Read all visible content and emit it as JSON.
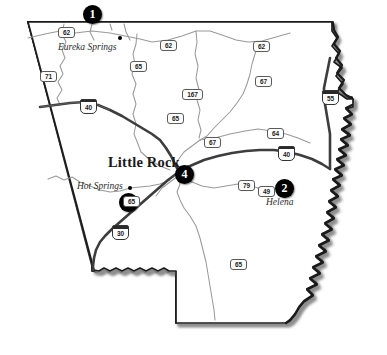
{
  "map": {
    "title": "Arkansas state map with numbered location markers",
    "state": "Arkansas",
    "background_color": "#ffffff",
    "outline_color": "#1a1a1a",
    "interstate_color": "#4a4a4a",
    "highway_color": "#8a8a8a",
    "marker_color": "#000000",
    "marker_text_color": "#ffffff"
  },
  "cities": [
    {
      "name": "Eureka Springs",
      "style": "minor",
      "x": 58,
      "y": 43,
      "dot_x": 118,
      "dot_y": 36
    },
    {
      "name": "Little Rock",
      "style": "major",
      "x": 111,
      "y": 162,
      "dot_x": -1,
      "dot_y": -1
    },
    {
      "name": "Hot Springs",
      "style": "minor",
      "x": 77,
      "y": 182,
      "dot_x": 128,
      "dot_y": 186
    },
    {
      "name": "Helena",
      "style": "minor",
      "x": 268,
      "y": 198,
      "dot_x": -1,
      "dot_y": -1
    }
  ],
  "markers": [
    {
      "label": "1",
      "x": 83,
      "y": 13,
      "near": "Eureka Springs"
    },
    {
      "label": "2",
      "x": 275,
      "y": 179,
      "near": "Helena"
    },
    {
      "label": "3",
      "x": 119,
      "y": 193,
      "near": "Hot Springs"
    },
    {
      "label": "4",
      "x": 175,
      "y": 169,
      "near": "Little Rock"
    }
  ],
  "highway_shields": [
    {
      "number": "62",
      "type": "us",
      "x": 58,
      "y": 27
    },
    {
      "number": "62",
      "type": "us",
      "x": 160,
      "y": 40
    },
    {
      "number": "62",
      "type": "us",
      "x": 253,
      "y": 41
    },
    {
      "number": "71",
      "type": "us",
      "x": 40,
      "y": 71
    },
    {
      "number": "65",
      "type": "us",
      "x": 130,
      "y": 61
    },
    {
      "number": "67",
      "type": "us",
      "x": 255,
      "y": 76
    },
    {
      "number": "167",
      "type": "us",
      "x": 186,
      "y": 89
    },
    {
      "number": "40",
      "type": "interstate",
      "x": 80,
      "y": 101
    },
    {
      "number": "55",
      "type": "interstate",
      "x": 322,
      "y": 92
    },
    {
      "number": "65",
      "type": "us",
      "x": 167,
      "y": 113
    },
    {
      "number": "67",
      "type": "us",
      "x": 204,
      "y": 137
    },
    {
      "number": "64",
      "type": "us",
      "x": 267,
      "y": 128
    },
    {
      "number": "40",
      "type": "interstate",
      "x": 278,
      "y": 148
    },
    {
      "number": "30",
      "type": "interstate",
      "x": 112,
      "y": 227
    },
    {
      "number": "65",
      "type": "us",
      "x": 123,
      "y": 196
    },
    {
      "number": "79",
      "type": "us",
      "x": 240,
      "y": 181
    },
    {
      "number": "49",
      "type": "us",
      "x": 259,
      "y": 186
    },
    {
      "number": "65",
      "type": "us",
      "x": 232,
      "y": 261
    }
  ]
}
